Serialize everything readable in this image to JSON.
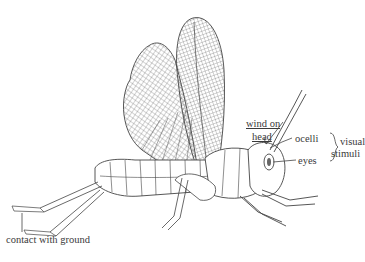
{
  "figure": {
    "labels": {
      "wind_line1": "wind on",
      "wind_line2": "head",
      "ocelli": "ocelli",
      "eyes": "eyes",
      "visual_line1": "visual",
      "visual_line2": "stimuli",
      "ground": "contact with ground"
    },
    "colors": {
      "line": "#4a4a4a",
      "background": "#ffffff"
    }
  }
}
